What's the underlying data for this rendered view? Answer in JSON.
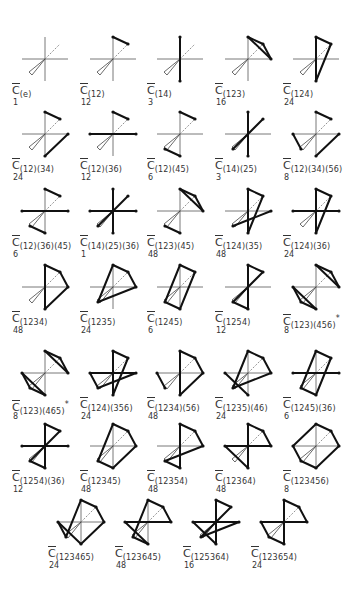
{
  "figure": {
    "vertices": {
      "1": [
        0,
        -22
      ],
      "2": [
        15,
        -15
      ],
      "3": [
        23,
        0
      ],
      "4": [
        0,
        22
      ],
      "5": [
        -15,
        15
      ],
      "6": [
        -23,
        0
      ]
    },
    "items": [
      {
        "symbol": "C",
        "sub": "(e)",
        "count": "1",
        "edges": [],
        "x": 45,
        "y": 59
      },
      {
        "symbol": "C",
        "sub": "(12)",
        "count": "12",
        "edges": [
          [
            1,
            2
          ]
        ],
        "x": 113,
        "y": 59
      },
      {
        "symbol": "C",
        "sub": "(14)",
        "count": "3",
        "edges": [
          [
            1,
            4
          ]
        ],
        "x": 180,
        "y": 59
      },
      {
        "symbol": "C",
        "sub": "(123)",
        "count": "16",
        "edges": [
          [
            1,
            2
          ],
          [
            2,
            3
          ],
          [
            3,
            1
          ]
        ],
        "x": 248,
        "y": 59
      },
      {
        "symbol": "C",
        "sub": "(124)",
        "count": "24",
        "edges": [
          [
            1,
            2
          ],
          [
            2,
            4
          ],
          [
            4,
            1
          ]
        ],
        "x": 316,
        "y": 59
      },
      {
        "symbol": "C",
        "sub": "(12)(34)",
        "count": "24",
        "edges": [
          [
            1,
            2
          ],
          [
            3,
            4
          ]
        ],
        "x": 45,
        "y": 134
      },
      {
        "symbol": "C",
        "sub": "(12)(36)",
        "count": "12",
        "edges": [
          [
            1,
            2
          ],
          [
            3,
            6
          ]
        ],
        "x": 113,
        "y": 134
      },
      {
        "symbol": "C",
        "sub": "(12)(45)",
        "count": "6",
        "edges": [
          [
            1,
            2
          ],
          [
            4,
            5
          ]
        ],
        "x": 180,
        "y": 134
      },
      {
        "symbol": "C",
        "sub": "(14)(25)",
        "count": "3",
        "edges": [
          [
            1,
            4
          ],
          [
            2,
            5
          ]
        ],
        "x": 248,
        "y": 134
      },
      {
        "symbol": "C",
        "sub": "(12)(34)(56)",
        "count": "8",
        "edges": [
          [
            1,
            2
          ],
          [
            3,
            4
          ],
          [
            5,
            6
          ]
        ],
        "x": 316,
        "y": 134
      },
      {
        "symbol": "C",
        "sub": "(12)(36)(45)",
        "count": "6",
        "edges": [
          [
            1,
            2
          ],
          [
            3,
            6
          ],
          [
            4,
            5
          ]
        ],
        "x": 45,
        "y": 211
      },
      {
        "symbol": "C",
        "sub": "(14)(25)(36)",
        "count": "1",
        "edges": [
          [
            1,
            4
          ],
          [
            2,
            5
          ],
          [
            3,
            6
          ]
        ],
        "x": 113,
        "y": 211
      },
      {
        "symbol": "C",
        "sub": "(123)(45)",
        "count": "48",
        "edges": [
          [
            1,
            2
          ],
          [
            2,
            3
          ],
          [
            3,
            1
          ],
          [
            4,
            5
          ]
        ],
        "x": 180,
        "y": 211
      },
      {
        "symbol": "C",
        "sub": "(124)(35)",
        "count": "48",
        "edges": [
          [
            1,
            2
          ],
          [
            2,
            4
          ],
          [
            4,
            1
          ],
          [
            3,
            5
          ]
        ],
        "x": 248,
        "y": 211
      },
      {
        "symbol": "C",
        "sub": "(124)(36)",
        "count": "24",
        "edges": [
          [
            1,
            2
          ],
          [
            2,
            4
          ],
          [
            4,
            1
          ],
          [
            3,
            6
          ]
        ],
        "x": 316,
        "y": 211
      },
      {
        "symbol": "C",
        "sub": "(1234)",
        "count": "48",
        "edges": [
          [
            1,
            2
          ],
          [
            2,
            3
          ],
          [
            3,
            4
          ],
          [
            4,
            1
          ]
        ],
        "x": 45,
        "y": 287
      },
      {
        "symbol": "C",
        "sub": "(1235)",
        "count": "24",
        "edges": [
          [
            1,
            2
          ],
          [
            2,
            3
          ],
          [
            3,
            5
          ],
          [
            5,
            1
          ]
        ],
        "x": 113,
        "y": 287
      },
      {
        "symbol": "C",
        "sub": "(1245)",
        "count": "6",
        "edges": [
          [
            1,
            2
          ],
          [
            2,
            4
          ],
          [
            4,
            5
          ],
          [
            5,
            1
          ]
        ],
        "x": 180,
        "y": 287
      },
      {
        "symbol": "C",
        "sub": "(1254)",
        "count": "12",
        "edges": [
          [
            1,
            2
          ],
          [
            2,
            5
          ],
          [
            5,
            4
          ],
          [
            4,
            1
          ]
        ],
        "x": 248,
        "y": 287
      },
      {
        "symbol": "C",
        "sub": "(123)(456)",
        "star": "*",
        "count": "8",
        "edges": [
          [
            1,
            2
          ],
          [
            2,
            3
          ],
          [
            3,
            1
          ],
          [
            4,
            5
          ],
          [
            5,
            6
          ],
          [
            6,
            4
          ]
        ],
        "x": 316,
        "y": 287
      },
      {
        "symbol": "C",
        "sub": "(123)(465)",
        "star": "*",
        "count": "8",
        "edges": [
          [
            1,
            2
          ],
          [
            2,
            3
          ],
          [
            3,
            1
          ],
          [
            4,
            6
          ],
          [
            6,
            5
          ],
          [
            5,
            4
          ]
        ],
        "x": 45,
        "y": 373
      },
      {
        "symbol": "C",
        "sub": "(124)(356)",
        "count": "24",
        "edges": [
          [
            1,
            2
          ],
          [
            2,
            4
          ],
          [
            4,
            1
          ],
          [
            3,
            5
          ],
          [
            5,
            6
          ],
          [
            6,
            3
          ]
        ],
        "x": 113,
        "y": 373
      },
      {
        "symbol": "C",
        "sub": "(1234)(56)",
        "count": "48",
        "edges": [
          [
            1,
            2
          ],
          [
            2,
            3
          ],
          [
            3,
            4
          ],
          [
            4,
            1
          ],
          [
            5,
            6
          ]
        ],
        "x": 180,
        "y": 373
      },
      {
        "symbol": "C",
        "sub": "(1235)(46)",
        "count": "24",
        "edges": [
          [
            1,
            2
          ],
          [
            2,
            3
          ],
          [
            3,
            5
          ],
          [
            5,
            1
          ],
          [
            4,
            6
          ]
        ],
        "x": 248,
        "y": 373
      },
      {
        "symbol": "C",
        "sub": "(1245)(36)",
        "count": "6",
        "edges": [
          [
            1,
            2
          ],
          [
            2,
            4
          ],
          [
            4,
            5
          ],
          [
            5,
            1
          ],
          [
            3,
            6
          ]
        ],
        "x": 316,
        "y": 373
      },
      {
        "symbol": "C",
        "sub": "(1254)(36)",
        "count": "12",
        "edges": [
          [
            1,
            2
          ],
          [
            2,
            5
          ],
          [
            5,
            4
          ],
          [
            4,
            1
          ],
          [
            3,
            6
          ]
        ],
        "x": 45,
        "y": 446
      },
      {
        "symbol": "C",
        "sub": "(12345)",
        "count": "48",
        "edges": [
          [
            1,
            2
          ],
          [
            2,
            3
          ],
          [
            3,
            4
          ],
          [
            4,
            5
          ],
          [
            5,
            1
          ]
        ],
        "x": 113,
        "y": 446
      },
      {
        "symbol": "C",
        "sub": "(12354)",
        "count": "48",
        "edges": [
          [
            1,
            2
          ],
          [
            2,
            3
          ],
          [
            3,
            5
          ],
          [
            5,
            4
          ],
          [
            4,
            1
          ]
        ],
        "x": 180,
        "y": 446
      },
      {
        "symbol": "C",
        "sub": "(12364)",
        "count": "48",
        "edges": [
          [
            1,
            2
          ],
          [
            2,
            3
          ],
          [
            3,
            6
          ],
          [
            6,
            4
          ],
          [
            4,
            1
          ]
        ],
        "x": 248,
        "y": 446
      },
      {
        "symbol": "C",
        "sub": "(123456)",
        "count": "8",
        "edges": [
          [
            1,
            2
          ],
          [
            2,
            3
          ],
          [
            3,
            4
          ],
          [
            4,
            5
          ],
          [
            5,
            6
          ],
          [
            6,
            1
          ]
        ],
        "x": 316,
        "y": 446
      },
      {
        "symbol": "C",
        "sub": "(123465)",
        "count": "24",
        "edges": [
          [
            1,
            2
          ],
          [
            2,
            3
          ],
          [
            3,
            4
          ],
          [
            4,
            6
          ],
          [
            6,
            5
          ],
          [
            5,
            1
          ]
        ],
        "x": 81,
        "y": 522
      },
      {
        "symbol": "C",
        "sub": "(123645)",
        "count": "48",
        "edges": [
          [
            1,
            2
          ],
          [
            2,
            3
          ],
          [
            3,
            6
          ],
          [
            6,
            4
          ],
          [
            4,
            5
          ],
          [
            5,
            1
          ]
        ],
        "x": 148,
        "y": 522
      },
      {
        "symbol": "C",
        "sub": "(125364)",
        "count": "16",
        "edges": [
          [
            1,
            2
          ],
          [
            2,
            5
          ],
          [
            5,
            3
          ],
          [
            3,
            6
          ],
          [
            6,
            4
          ],
          [
            4,
            1
          ]
        ],
        "x": 216,
        "y": 522
      },
      {
        "symbol": "C",
        "sub": "(123654)",
        "count": "24",
        "edges": [
          [
            1,
            2
          ],
          [
            2,
            3
          ],
          [
            3,
            6
          ],
          [
            6,
            5
          ],
          [
            5,
            4
          ],
          [
            4,
            1
          ]
        ],
        "x": 284,
        "y": 522
      }
    ]
  }
}
